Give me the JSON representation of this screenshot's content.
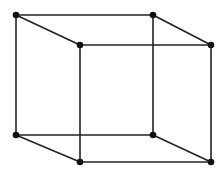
{
  "diagram": {
    "stroke_color": "#222222",
    "vertex_color": "#111111",
    "vertices": [
      {
        "id": "A",
        "x": 16,
        "y": 15
      },
      {
        "id": "B",
        "x": 153,
        "y": 15
      },
      {
        "id": "C",
        "x": 80,
        "y": 45
      },
      {
        "id": "D",
        "x": 211,
        "y": 45
      },
      {
        "id": "E",
        "x": 16,
        "y": 135
      },
      {
        "id": "F",
        "x": 153,
        "y": 135
      },
      {
        "id": "G",
        "x": 80,
        "y": 162
      },
      {
        "id": "H",
        "x": 211,
        "y": 162
      }
    ],
    "edges": [
      [
        "A",
        "B"
      ],
      [
        "C",
        "D"
      ],
      [
        "E",
        "F"
      ],
      [
        "G",
        "H"
      ],
      [
        "A",
        "C"
      ],
      [
        "B",
        "D"
      ],
      [
        "E",
        "G"
      ],
      [
        "F",
        "H"
      ],
      [
        "A",
        "E"
      ],
      [
        "B",
        "F"
      ],
      [
        "C",
        "G"
      ],
      [
        "D",
        "H"
      ]
    ]
  }
}
